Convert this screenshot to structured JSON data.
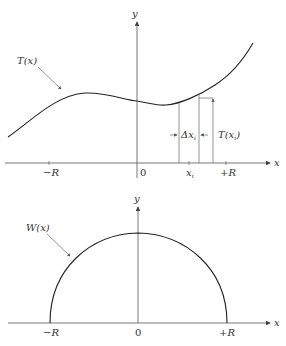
{
  "top_plot": {
    "y_axis_label": "y",
    "x_axis_label": "x",
    "curve_label": "T(x)",
    "tick_labels": {
      "neg_r": "−R",
      "zero": "0",
      "xi": "x",
      "xi_sub": "i",
      "pos_r": "+R"
    },
    "delta_label": "Δx",
    "delta_sub": "i",
    "value_label": "T(x",
    "value_sub": "i",
    "value_close": ")"
  },
  "bottom_plot": {
    "y_axis_label": "y",
    "x_axis_label": "x",
    "curve_label": "W(x)",
    "tick_labels": {
      "neg_r": "−R",
      "zero": "0",
      "pos_r": "+R"
    }
  },
  "colors": {
    "line": "#222222",
    "axis": "#555555",
    "text": "#333333"
  }
}
